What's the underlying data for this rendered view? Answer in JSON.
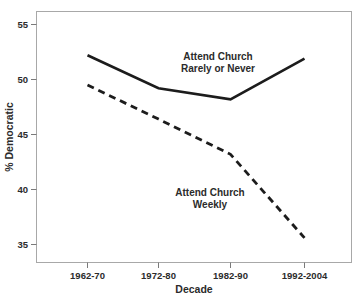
{
  "chart_data": {
    "type": "line",
    "title": "",
    "xlabel": "Decade",
    "ylabel": "% Democratic",
    "categories": [
      "1962-70",
      "1972-80",
      "1982-90",
      "1992-2004"
    ],
    "series": [
      {
        "name": "Attend Church Rarely or Never",
        "style": "solid",
        "color": "#1c1c1c",
        "values": [
          52.2,
          49.2,
          48.2,
          51.9
        ]
      },
      {
        "name": "Attend Church Weekly",
        "style": "dashed",
        "color": "#1c1c1c",
        "values": [
          49.5,
          46.4,
          43.2,
          35.6
        ]
      }
    ],
    "ylim": [
      33.2,
      56.4
    ],
    "yticks": [
      35,
      40,
      45,
      50,
      55
    ],
    "ytick_labels": [
      "35",
      "40",
      "45",
      "50",
      "55"
    ],
    "grid": false,
    "legend": "inline-annotations",
    "annotations": [
      {
        "id": "rarely-or-never",
        "line1": "Attend Church",
        "line2": "Rarely or Never",
        "x": 218,
        "y": 60
      },
      {
        "id": "weekly",
        "line1": "Attend Church",
        "line2": "Weekly",
        "x": 210,
        "y": 196
      }
    ]
  },
  "axes": {
    "y_title": "% Democratic",
    "x_title": "Decade",
    "y_tick_labels": [
      "55",
      "50",
      "45",
      "40",
      "35"
    ],
    "x_tick_labels": [
      "1962-70",
      "1972-80",
      "1982-90",
      "1992-2004"
    ]
  }
}
